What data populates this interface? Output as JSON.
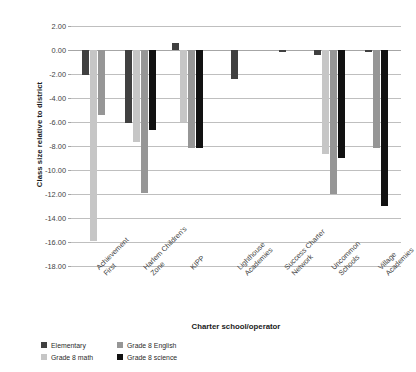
{
  "chart_data": {
    "type": "bar",
    "title": "",
    "xlabel": "Charter school/operator",
    "ylabel": "Class size relative to district",
    "ylim": [
      -18.0,
      2.0
    ],
    "ytick_step": 2.0,
    "ytick_labels": [
      "2.00",
      "0.00",
      "-2.00",
      "-4.00",
      "-6.00",
      "-8.00",
      "-10.00",
      "-12.00",
      "-14.00",
      "-16.00",
      "-18.00"
    ],
    "grid": true,
    "legend_position": "bottom-left",
    "categories": [
      "Achievement First",
      "Harlem Children's Zone",
      "KIPP",
      "Lighthouse Academies",
      "Success Charter Network",
      "Uncommon Schools",
      "Village Academies"
    ],
    "series": [
      {
        "name": "Elementary",
        "color": "#404040",
        "values": [
          -2.1,
          -6.1,
          0.6,
          -2.4,
          -0.2,
          -0.4,
          -0.15
        ]
      },
      {
        "name": "Grade 8 math",
        "color": "#c6c6c6",
        "values": [
          -15.9,
          -7.7,
          -6.0,
          null,
          null,
          -8.7,
          null
        ]
      },
      {
        "name": "Grade 8 English",
        "color": "#969696",
        "values": [
          -5.4,
          -11.9,
          -8.2,
          null,
          null,
          -12.0,
          -8.2
        ]
      },
      {
        "name": "Grade 8 science",
        "color": "#111111",
        "values": [
          null,
          -6.7,
          -8.2,
          null,
          null,
          -9.0,
          -13.0
        ]
      }
    ]
  },
  "legend": {
    "items": [
      {
        "label": "Elementary",
        "color": "#404040"
      },
      {
        "label": "Grade 8 English",
        "color": "#969696"
      },
      {
        "label": "Grade 8 math",
        "color": "#c6c6c6"
      },
      {
        "label": "Grade 8 science",
        "color": "#111111"
      }
    ]
  },
  "axis": {
    "x_title": "Charter school/operator",
    "y_title": "Class size relative to district"
  }
}
